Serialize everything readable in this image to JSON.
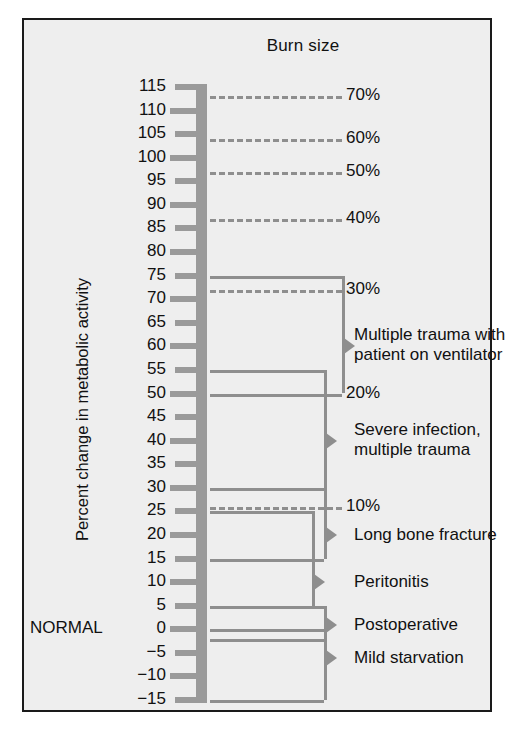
{
  "figure": {
    "title": "Burn size",
    "y_axis_label": "Percent change in metabolic activity",
    "normal_marker": "NORMAL",
    "caption": ""
  },
  "colors": {
    "background": "#eeeeee",
    "frame": "#1a1a1a",
    "graphic_gray": "#9a9a9a",
    "line_gray": "#8e8e8e",
    "text": "#111111"
  },
  "chart_data": {
    "type": "bar",
    "title": "Burn size",
    "xlabel": "",
    "ylabel": "Percent change in metabolic activity",
    "ylim": [
      -15,
      115
    ],
    "grid": false,
    "legend_position": "none",
    "axis_ticks": [
      115,
      110,
      105,
      100,
      95,
      90,
      85,
      80,
      75,
      70,
      65,
      60,
      55,
      50,
      45,
      40,
      35,
      30,
      25,
      20,
      15,
      10,
      5,
      0,
      -5,
      -10,
      -15
    ],
    "tick_labels": [
      "115",
      "110",
      "105",
      "100",
      "95",
      "90",
      "85",
      "80",
      "75",
      "70",
      "65",
      "60",
      "55",
      "50",
      "45",
      "40",
      "35",
      "30",
      "25",
      "20",
      "15",
      "10",
      "5",
      "0",
      "−5",
      "−10",
      "−15"
    ],
    "normal_value": 0,
    "burn_size_lines": [
      {
        "label": "70%",
        "value": 113
      },
      {
        "label": "60%",
        "value": 104
      },
      {
        "label": "50%",
        "value": 97
      },
      {
        "label": "40%",
        "value": 87
      },
      {
        "label": "30%",
        "value": 72
      },
      {
        "label": "20%",
        "value": 50
      },
      {
        "label": "10%",
        "value": 26
      }
    ],
    "conditions": [
      {
        "label": "Multiple trauma with\npatient on ventilator",
        "line1": "Multiple trauma with",
        "line2": "patient on ventilator",
        "low": 50,
        "high": 75,
        "marker": 60
      },
      {
        "label": "Severe infection,\nmultiple trauma",
        "line1": "Severe infection,",
        "line2": "multiple trauma",
        "low": 30,
        "high": 55,
        "marker": 40
      },
      {
        "label": "Long bone fracture",
        "line1": "Long bone fracture",
        "line2": "",
        "low": 15,
        "high": 30,
        "marker": 20
      },
      {
        "label": "Peritonitis",
        "line1": "Peritonitis",
        "line2": "",
        "low": 5,
        "high": 25,
        "marker": 10
      },
      {
        "label": "Postoperative",
        "line1": "Postoperative",
        "line2": "",
        "low": -2,
        "high": 5,
        "marker": 1
      },
      {
        "label": "Mild starvation",
        "line1": "Mild starvation",
        "line2": "",
        "low": -15,
        "high": 0,
        "marker": -6
      }
    ]
  }
}
